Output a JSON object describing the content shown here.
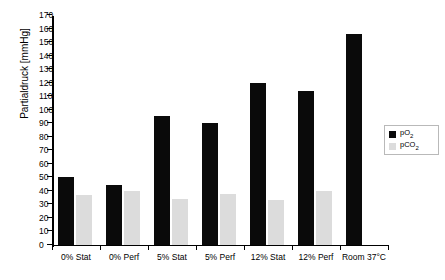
{
  "chart_data": {
    "type": "bar",
    "title": "",
    "xlabel": "",
    "ylabel": "Partialdruck [mmHg]",
    "ylim": [
      0,
      170
    ],
    "ytick_step": 10,
    "grid": false,
    "legend_position": "center-right",
    "categories": [
      "0% Stat",
      "0% Perf",
      "5% Stat",
      "5% Perf",
      "12% Stat",
      "12% Perf",
      "Room 37°C"
    ],
    "series": [
      {
        "name": "pO2",
        "label_html": "pO<sub>2</sub>",
        "color": "#0a0a0a",
        "values": [
          50,
          44,
          95,
          90,
          120,
          114,
          156
        ]
      },
      {
        "name": "pCO2",
        "label_html": "pCO<sub>2</sub>",
        "color": "#dcdcdc",
        "values": [
          37,
          40,
          34,
          38,
          33,
          40,
          0
        ]
      }
    ],
    "ytick_labels": [
      "0",
      "10",
      "20",
      "30",
      "40",
      "50",
      "60",
      "70",
      "80",
      "90",
      "100",
      "110",
      "120",
      "130",
      "140",
      "150",
      "160",
      "170"
    ]
  },
  "axes": {
    "y_title": "Partialdruck [mmHg]"
  },
  "legend": {
    "items": [
      {
        "label": "pO2",
        "color": "#0a0a0a"
      },
      {
        "label": "pCO2",
        "color": "#dcdcdc"
      }
    ]
  }
}
